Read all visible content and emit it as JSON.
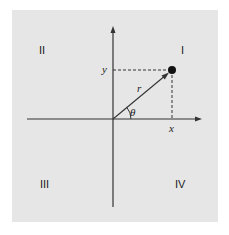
{
  "diagram": {
    "quadrants": {
      "q1": "I",
      "q2": "II",
      "q3": "III",
      "q4": "IV"
    },
    "labels": {
      "x": "x",
      "y": "y",
      "r": "r",
      "theta": "θ"
    },
    "colors": {
      "background": "#ffffff",
      "panel": "#e6e6e6",
      "ink": "#222222"
    },
    "geometry": {
      "origin": [
        113,
        119
      ],
      "point": [
        172,
        70
      ],
      "x_axis": [
        27,
        201
      ],
      "y_axis": [
        27,
        207
      ]
    }
  }
}
